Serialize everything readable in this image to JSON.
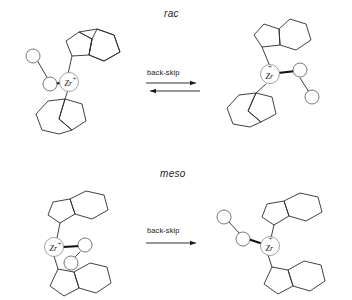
{
  "figure": {
    "type": "reaction-scheme",
    "background_color": "#ffffff",
    "line_color": "#2b2b2b",
    "width": 352,
    "height": 300
  },
  "rows": [
    {
      "id": "rac",
      "label": "rac",
      "label_style": "italic",
      "arrow": {
        "label": "back-skip",
        "type": "equilibrium",
        "directions": [
          "forward",
          "reverse"
        ]
      },
      "reactant": {
        "name": "rac-bis(indenyl) zirconocene cation, chain on left",
        "metal_label": "Zr",
        "metal_charge": "+",
        "ligands": [
          "indenyl-upper-right",
          "indenyl-lower-left"
        ],
        "chain_atoms": 2,
        "chain_side": "left"
      },
      "product": {
        "name": "rac-bis(indenyl) zirconocene cation, chain on right",
        "metal_label": "Zr",
        "metal_charge": "+",
        "ligands": [
          "indenyl-upper-right",
          "indenyl-lower-left"
        ],
        "chain_atoms": 2,
        "chain_side": "right"
      }
    },
    {
      "id": "meso",
      "label": "meso",
      "label_style": "italic",
      "arrow": {
        "label": "back-skip",
        "type": "single",
        "directions": [
          "forward"
        ]
      },
      "reactant": {
        "name": "meso-bis(indenyl) zirconocene cation, chain on right",
        "metal_label": "Zr",
        "metal_charge": "+",
        "ligands": [
          "indenyl-upper-right",
          "indenyl-lower-right"
        ],
        "chain_atoms": 2,
        "chain_side": "right"
      },
      "product": {
        "name": "meso-bis(indenyl) zirconocene cation, chain on left",
        "metal_label": "Zr",
        "metal_charge": "+",
        "ligands": [
          "indenyl-upper-right",
          "indenyl-lower-right"
        ],
        "chain_atoms": 2,
        "chain_side": "left"
      }
    }
  ]
}
